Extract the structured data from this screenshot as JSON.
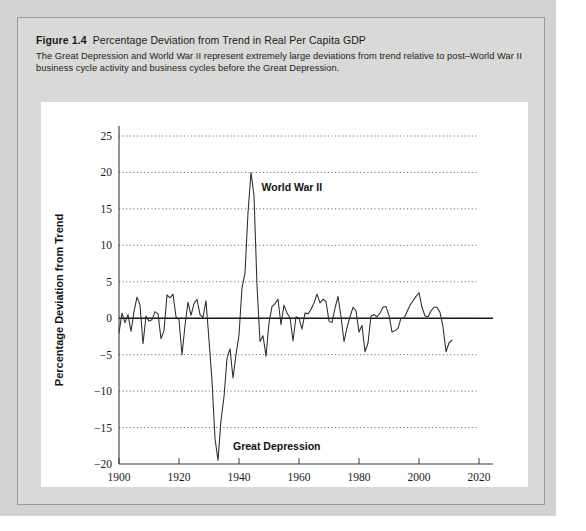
{
  "figure": {
    "number_label": "Figure 1.4",
    "title": "Percentage Deviation from Trend in Real Per Capita GDP",
    "description_line1": "The Great Depression and World War II represent extremely large deviations from trend relative to post–World War II",
    "description_line2": "business cycle activity and business cycles before the Great Depression."
  },
  "colors": {
    "page_background": "#ffffff",
    "backdrop": "#d2d2d2",
    "panel_background": "#d9d9d7",
    "panel_border": "#9a9a98",
    "chart_background": "#ffffff",
    "line": "#2b2b2b",
    "zero_line": "#1a1a1a",
    "grid": "#4a4a4a",
    "axis": "#3a3a3a",
    "text": "#1a1a1a"
  },
  "chart_data": {
    "type": "line",
    "title": "Percentage Deviation from Trend in Real Per Capita GDP",
    "xlabel": "Year",
    "ylabel": "Percentage Deviation from Trend",
    "xlim": [
      1900,
      2020
    ],
    "ylim": [
      -20,
      25
    ],
    "xticks": [
      1900,
      1920,
      1940,
      1960,
      1980,
      2000,
      2020
    ],
    "yticks": [
      -20,
      -15,
      -10,
      -5,
      0,
      5,
      10,
      15,
      20,
      25
    ],
    "xtick_labels": [
      "1900",
      "1920",
      "1940",
      "1960",
      "1980",
      "2000",
      "2020"
    ],
    "ytick_labels": [
      "−20",
      "−15",
      "−10",
      "−5",
      "0",
      "5",
      "10",
      "15",
      "20",
      "25"
    ],
    "grid": "horizontal-dotted",
    "legend": "none",
    "zero_reference_line": 0,
    "annotations": [
      {
        "label": "World War II",
        "x": 1947.5,
        "y": 18.0,
        "points_to": {
          "x": 1944,
          "y": 20
        }
      },
      {
        "label": "Great Depression",
        "x": 1938.0,
        "y": -17.5,
        "points_to": {
          "x": 1933,
          "y": -19.5
        }
      }
    ],
    "series": [
      {
        "name": "Percentage Deviation from Trend",
        "x": [
          1900,
          1901,
          1902,
          1903,
          1904,
          1905,
          1906,
          1907,
          1908,
          1909,
          1910,
          1911,
          1912,
          1913,
          1914,
          1915,
          1916,
          1917,
          1918,
          1919,
          1920,
          1921,
          1922,
          1923,
          1924,
          1925,
          1926,
          1927,
          1928,
          1929,
          1930,
          1931,
          1932,
          1933,
          1934,
          1935,
          1936,
          1937,
          1938,
          1939,
          1940,
          1941,
          1942,
          1943,
          1944,
          1945,
          1946,
          1947,
          1948,
          1949,
          1950,
          1951,
          1952,
          1953,
          1954,
          1955,
          1956,
          1957,
          1958,
          1959,
          1960,
          1961,
          1962,
          1963,
          1964,
          1965,
          1966,
          1967,
          1968,
          1969,
          1970,
          1971,
          1972,
          1973,
          1974,
          1975,
          1976,
          1977,
          1978,
          1979,
          1980,
          1981,
          1982,
          1983,
          1984,
          1985,
          1986,
          1987,
          1988,
          1989,
          1990,
          1991,
          1992,
          1993,
          1994,
          1995,
          1996,
          1997,
          1998,
          1999,
          2000,
          2001,
          2002,
          2003,
          2004,
          2005,
          2006,
          2007,
          2008,
          2009,
          2010,
          2011
        ],
        "values": [
          -2.0,
          0.7,
          -0.6,
          0.5,
          -1.8,
          0.9,
          2.9,
          1.8,
          -3.5,
          0.3,
          -0.4,
          -0.2,
          0.9,
          0.6,
          -2.8,
          -1.7,
          3.2,
          2.8,
          3.3,
          0.2,
          -0.2,
          -5.0,
          -1.0,
          2.2,
          0.4,
          2.0,
          2.6,
          0.5,
          0.1,
          2.4,
          -3.0,
          -8.6,
          -16.5,
          -19.5,
          -14.0,
          -10.8,
          -5.5,
          -4.2,
          -8.2,
          -5.0,
          -2.3,
          4.2,
          6.2,
          14.5,
          20.0,
          16.8,
          4.5,
          -3.2,
          -2.4,
          -5.2,
          -0.6,
          1.6,
          2.0,
          2.6,
          -0.9,
          1.8,
          0.7,
          0.1,
          -3.1,
          0.2,
          0.0,
          -1.5,
          0.7,
          0.6,
          1.2,
          2.1,
          3.3,
          2.1,
          2.6,
          2.3,
          -0.4,
          -0.6,
          1.4,
          3.0,
          0.2,
          -3.2,
          -1.3,
          0.2,
          1.5,
          1.0,
          -1.9,
          -1.0,
          -4.6,
          -3.4,
          0.3,
          0.5,
          0.2,
          0.7,
          1.5,
          1.6,
          0.4,
          -1.9,
          -1.7,
          -1.4,
          0.0,
          0.0,
          0.9,
          1.8,
          2.4,
          3.0,
          3.5,
          1.5,
          0.3,
          0.2,
          1.0,
          1.5,
          1.5,
          0.8,
          -1.2,
          -4.6,
          -3.4,
          -3.0
        ]
      }
    ]
  }
}
